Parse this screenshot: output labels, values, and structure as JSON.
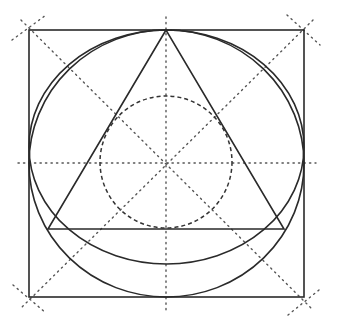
{
  "diagram": {
    "canvas": {
      "width": 337,
      "height": 322,
      "background": "#ffffff"
    },
    "colors": {
      "stroke": "#2a2a2a",
      "dashed": "#333333",
      "dotted": "#555555"
    },
    "square": {
      "x": 29,
      "y": 30,
      "width": 275,
      "height": 267
    },
    "outer_circle": {
      "cx": 166.5,
      "cy": 163.5,
      "rx": 137.5,
      "ry": 133.5
    },
    "ellipse": {
      "cx": 166.5,
      "cy": 147,
      "rx": 137.5,
      "ry": 117
    },
    "triangle": {
      "apex": [
        166,
        30
      ],
      "left": [
        48,
        229
      ],
      "right": [
        284,
        229
      ]
    },
    "dashed_circle": {
      "cx": 166,
      "cy": 162,
      "r": 66
    },
    "center_lines": {
      "horizontal": {
        "x1": 18,
        "y1": 163,
        "x2": 316,
        "y2": 163
      },
      "vertical": {
        "x1": 166,
        "y1": 17,
        "x2": 166,
        "y2": 310
      }
    },
    "diagonals": [
      {
        "x1": 21,
        "y1": 20,
        "x2": 312,
        "y2": 309
      },
      {
        "x1": 313,
        "y1": 20,
        "x2": 20,
        "y2": 309
      }
    ],
    "corner_ticks": [
      {
        "x1": 12,
        "y1": 40,
        "x2": 46,
        "y2": 15
      },
      {
        "x1": 287,
        "y1": 15,
        "x2": 320,
        "y2": 45
      },
      {
        "x1": 13,
        "y1": 285,
        "x2": 46,
        "y2": 313
      },
      {
        "x1": 288,
        "y1": 315,
        "x2": 319,
        "y2": 290
      }
    ]
  }
}
